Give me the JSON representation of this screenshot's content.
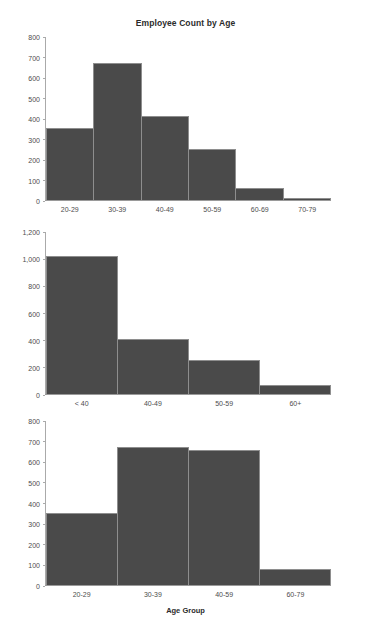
{
  "chart_data": [
    {
      "type": "bar",
      "title": "Employee Count by Age",
      "xlabel": "",
      "ylabel": "",
      "categories": [
        "20-29",
        "30-39",
        "40-49",
        "50-59",
        "60-69",
        "70-79"
      ],
      "values": [
        352,
        672,
        410,
        248,
        60,
        10
      ],
      "yticks": [
        "0",
        "100",
        "200",
        "300",
        "400",
        "500",
        "600",
        "700",
        "800"
      ],
      "ytick_values": [
        0,
        100,
        200,
        300,
        400,
        500,
        600,
        700,
        800
      ],
      "ylim": [
        0,
        800
      ],
      "grid": false,
      "legend": "none",
      "bar_color": "#4a4a4a",
      "bar_edge_color": "#8e8e8e"
    },
    {
      "type": "bar",
      "title": "",
      "xlabel": "",
      "ylabel": "",
      "categories": [
        "< 40",
        "40-49",
        "50-59",
        "60+"
      ],
      "values": [
        1025,
        410,
        250,
        70
      ],
      "yticks": [
        "0",
        "200",
        "400",
        "600",
        "800",
        "1,000",
        "1,200"
      ],
      "ytick_values": [
        0,
        200,
        400,
        600,
        800,
        1000,
        1200
      ],
      "ylim": [
        0,
        1200
      ],
      "grid": false,
      "legend": "none",
      "bar_color": "#4a4a4a",
      "bar_edge_color": "#8e8e8e"
    },
    {
      "type": "bar",
      "title": "",
      "xlabel": "Age Group",
      "ylabel": "",
      "categories": [
        "20-29",
        "30-39",
        "40-59",
        "60-79"
      ],
      "values": [
        352,
        672,
        660,
        80
      ],
      "yticks": [
        "0",
        "100",
        "200",
        "300",
        "400",
        "500",
        "600",
        "700",
        "800"
      ],
      "ytick_values": [
        0,
        100,
        200,
        300,
        400,
        500,
        600,
        700,
        800
      ],
      "ylim": [
        0,
        800
      ],
      "grid": false,
      "legend": "none",
      "bar_color": "#4a4a4a",
      "bar_edge_color": "#8e8e8e"
    }
  ]
}
